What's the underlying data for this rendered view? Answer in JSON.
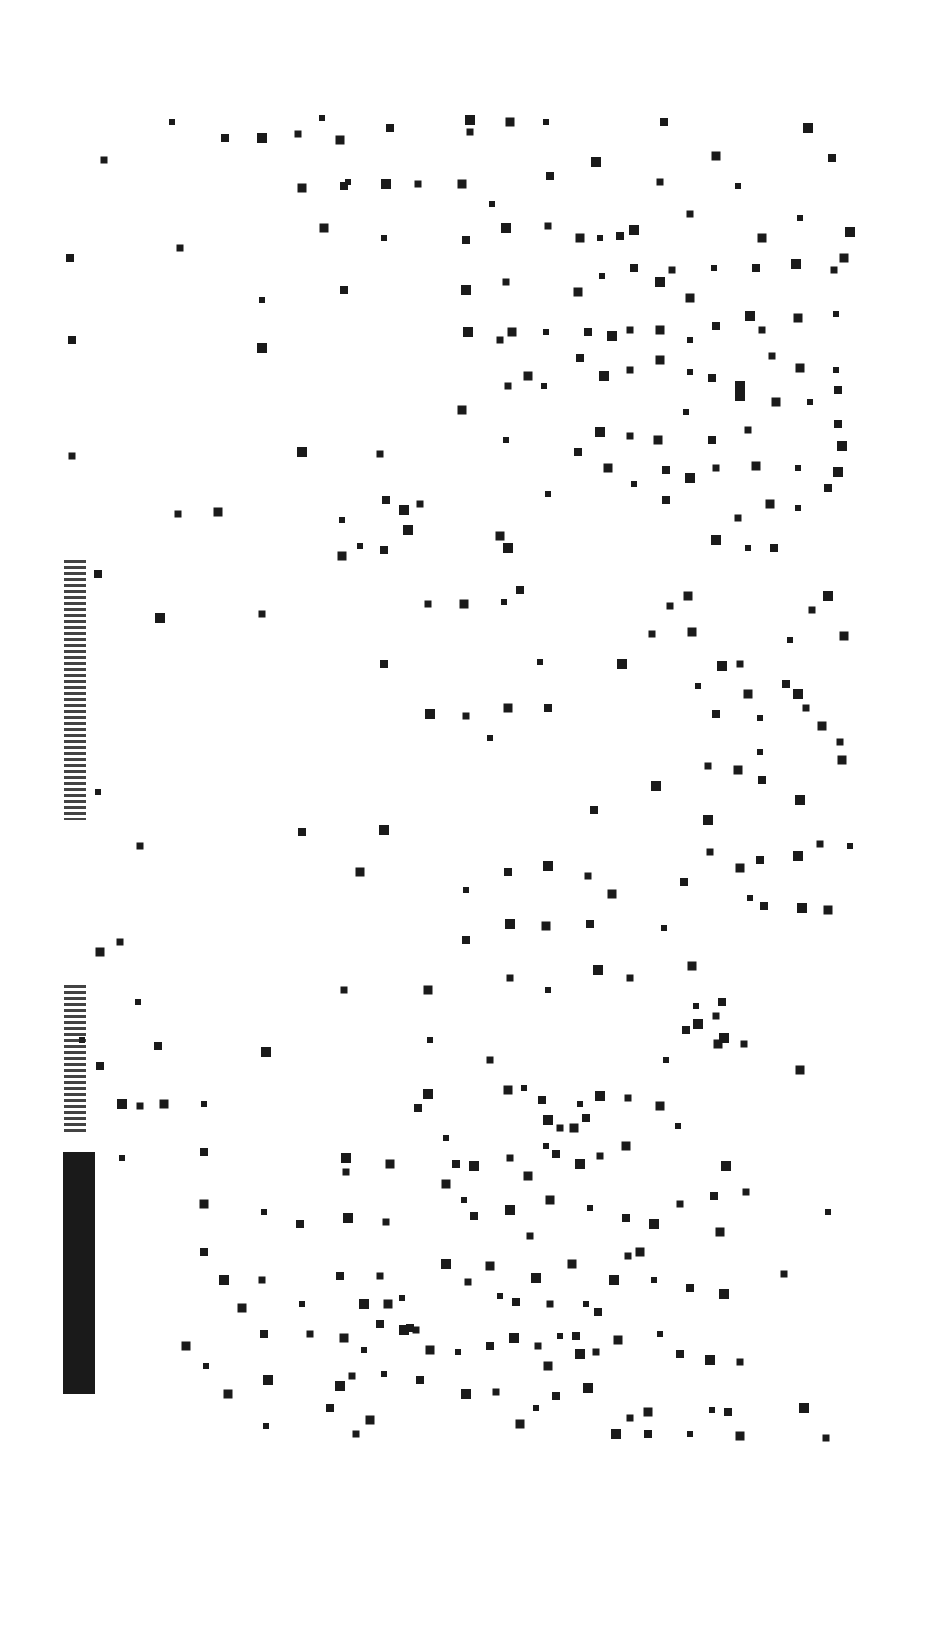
{
  "chart_data": {
    "type": "scatter",
    "title": "",
    "xlabel": "",
    "ylabel": "",
    "grid": false,
    "legend": null,
    "marker": "square",
    "marker_color": "#1a1a1a",
    "background": "#ffffff",
    "points": [
      [
        172,
        122
      ],
      [
        225,
        138
      ],
      [
        262,
        138
      ],
      [
        298,
        134
      ],
      [
        340,
        140
      ],
      [
        322,
        118
      ],
      [
        390,
        128
      ],
      [
        470,
        120
      ],
      [
        470,
        132
      ],
      [
        510,
        122
      ],
      [
        546,
        122
      ],
      [
        664,
        122
      ],
      [
        808,
        128
      ],
      [
        104,
        160
      ],
      [
        302,
        188
      ],
      [
        348,
        182
      ],
      [
        344,
        186
      ],
      [
        386,
        184
      ],
      [
        418,
        184
      ],
      [
        462,
        184
      ],
      [
        492,
        204
      ],
      [
        550,
        176
      ],
      [
        596,
        162
      ],
      [
        660,
        182
      ],
      [
        716,
        156
      ],
      [
        738,
        186
      ],
      [
        832,
        158
      ],
      [
        850,
        232
      ],
      [
        180,
        248
      ],
      [
        324,
        228
      ],
      [
        384,
        238
      ],
      [
        466,
        240
      ],
      [
        506,
        228
      ],
      [
        548,
        226
      ],
      [
        580,
        238
      ],
      [
        600,
        238
      ],
      [
        620,
        236
      ],
      [
        634,
        230
      ],
      [
        690,
        214
      ],
      [
        762,
        238
      ],
      [
        800,
        218
      ],
      [
        70,
        258
      ],
      [
        466,
        290
      ],
      [
        506,
        282
      ],
      [
        578,
        292
      ],
      [
        602,
        276
      ],
      [
        634,
        268
      ],
      [
        660,
        282
      ],
      [
        672,
        270
      ],
      [
        690,
        298
      ],
      [
        714,
        268
      ],
      [
        756,
        268
      ],
      [
        796,
        264
      ],
      [
        834,
        270
      ],
      [
        844,
        258
      ],
      [
        262,
        300
      ],
      [
        344,
        290
      ],
      [
        468,
        332
      ],
      [
        500,
        340
      ],
      [
        512,
        332
      ],
      [
        546,
        332
      ],
      [
        588,
        332
      ],
      [
        612,
        336
      ],
      [
        630,
        330
      ],
      [
        660,
        330
      ],
      [
        690,
        340
      ],
      [
        716,
        326
      ],
      [
        750,
        316
      ],
      [
        762,
        330
      ],
      [
        798,
        318
      ],
      [
        836,
        314
      ],
      [
        72,
        340
      ],
      [
        262,
        348
      ],
      [
        508,
        386
      ],
      [
        528,
        376
      ],
      [
        544,
        386
      ],
      [
        580,
        358
      ],
      [
        604,
        376
      ],
      [
        630,
        370
      ],
      [
        660,
        360
      ],
      [
        690,
        372
      ],
      [
        712,
        378
      ],
      [
        740,
        386
      ],
      [
        772,
        356
      ],
      [
        800,
        368
      ],
      [
        836,
        370
      ],
      [
        838,
        390
      ],
      [
        302,
        452
      ],
      [
        380,
        454
      ],
      [
        462,
        410
      ],
      [
        506,
        440
      ],
      [
        578,
        452
      ],
      [
        600,
        432
      ],
      [
        630,
        436
      ],
      [
        658,
        440
      ],
      [
        686,
        412
      ],
      [
        712,
        440
      ],
      [
        740,
        396
      ],
      [
        748,
        430
      ],
      [
        776,
        402
      ],
      [
        810,
        402
      ],
      [
        838,
        424
      ],
      [
        842,
        446
      ],
      [
        72,
        456
      ],
      [
        608,
        468
      ],
      [
        634,
        484
      ],
      [
        666,
        470
      ],
      [
        690,
        478
      ],
      [
        716,
        468
      ],
      [
        756,
        466
      ],
      [
        798,
        468
      ],
      [
        828,
        488
      ],
      [
        838,
        472
      ],
      [
        178,
        514
      ],
      [
        218,
        512
      ],
      [
        342,
        520
      ],
      [
        386,
        500
      ],
      [
        404,
        510
      ],
      [
        420,
        504
      ],
      [
        500,
        536
      ],
      [
        548,
        494
      ],
      [
        666,
        500
      ],
      [
        716,
        540
      ],
      [
        738,
        518
      ],
      [
        770,
        504
      ],
      [
        798,
        508
      ],
      [
        98,
        574
      ],
      [
        160,
        618
      ],
      [
        262,
        614
      ],
      [
        342,
        556
      ],
      [
        360,
        546
      ],
      [
        384,
        550
      ],
      [
        408,
        530
      ],
      [
        428,
        604
      ],
      [
        464,
        604
      ],
      [
        504,
        602
      ],
      [
        520,
        590
      ],
      [
        508,
        548
      ],
      [
        670,
        606
      ],
      [
        688,
        596
      ],
      [
        748,
        548
      ],
      [
        774,
        548
      ],
      [
        828,
        596
      ],
      [
        812,
        610
      ],
      [
        844,
        636
      ],
      [
        790,
        640
      ],
      [
        384,
        664
      ],
      [
        430,
        714
      ],
      [
        466,
        716
      ],
      [
        508,
        708
      ],
      [
        540,
        662
      ],
      [
        548,
        708
      ],
      [
        622,
        664
      ],
      [
        652,
        634
      ],
      [
        692,
        632
      ],
      [
        698,
        686
      ],
      [
        716,
        714
      ],
      [
        722,
        666
      ],
      [
        740,
        664
      ],
      [
        748,
        694
      ],
      [
        760,
        718
      ],
      [
        786,
        684
      ],
      [
        798,
        694
      ],
      [
        806,
        708
      ],
      [
        822,
        726
      ],
      [
        490,
        738
      ],
      [
        594,
        810
      ],
      [
        656,
        786
      ],
      [
        708,
        766
      ],
      [
        738,
        770
      ],
      [
        760,
        752
      ],
      [
        762,
        780
      ],
      [
        800,
        800
      ],
      [
        840,
        742
      ],
      [
        842,
        760
      ],
      [
        98,
        792
      ],
      [
        302,
        832
      ],
      [
        384,
        830
      ],
      [
        140,
        846
      ],
      [
        360,
        872
      ],
      [
        466,
        890
      ],
      [
        508,
        872
      ],
      [
        548,
        866
      ],
      [
        588,
        876
      ],
      [
        612,
        894
      ],
      [
        664,
        928
      ],
      [
        684,
        882
      ],
      [
        708,
        820
      ],
      [
        710,
        852
      ],
      [
        740,
        868
      ],
      [
        750,
        898
      ],
      [
        760,
        860
      ],
      [
        798,
        856
      ],
      [
        820,
        844
      ],
      [
        828,
        910
      ],
      [
        850,
        846
      ],
      [
        764,
        906
      ],
      [
        802,
        908
      ],
      [
        120,
        942
      ],
      [
        100,
        952
      ],
      [
        138,
        1002
      ],
      [
        158,
        1046
      ],
      [
        266,
        1052
      ],
      [
        344,
        990
      ],
      [
        428,
        990
      ],
      [
        430,
        1040
      ],
      [
        466,
        940
      ],
      [
        510,
        924
      ],
      [
        510,
        978
      ],
      [
        546,
        926
      ],
      [
        548,
        990
      ],
      [
        590,
        924
      ],
      [
        598,
        970
      ],
      [
        630,
        978
      ],
      [
        692,
        966
      ],
      [
        696,
        1006
      ],
      [
        722,
        1002
      ],
      [
        724,
        1038
      ],
      [
        744,
        1044
      ],
      [
        800,
        1070
      ],
      [
        82,
        1040
      ],
      [
        100,
        1066
      ],
      [
        122,
        1104
      ],
      [
        140,
        1106
      ],
      [
        164,
        1104
      ],
      [
        204,
        1104
      ],
      [
        418,
        1108
      ],
      [
        428,
        1094
      ],
      [
        490,
        1060
      ],
      [
        508,
        1090
      ],
      [
        524,
        1088
      ],
      [
        542,
        1100
      ],
      [
        548,
        1120
      ],
      [
        560,
        1128
      ],
      [
        574,
        1128
      ],
      [
        580,
        1104
      ],
      [
        586,
        1118
      ],
      [
        600,
        1096
      ],
      [
        628,
        1098
      ],
      [
        660,
        1106
      ],
      [
        666,
        1060
      ],
      [
        686,
        1030
      ],
      [
        698,
        1024
      ],
      [
        716,
        1016
      ],
      [
        718,
        1044
      ],
      [
        122,
        1158
      ],
      [
        204,
        1152
      ],
      [
        346,
        1158
      ],
      [
        346,
        1172
      ],
      [
        390,
        1164
      ],
      [
        446,
        1138
      ],
      [
        456,
        1164
      ],
      [
        474,
        1166
      ],
      [
        510,
        1158
      ],
      [
        528,
        1176
      ],
      [
        546,
        1146
      ],
      [
        556,
        1154
      ],
      [
        580,
        1164
      ],
      [
        600,
        1156
      ],
      [
        626,
        1146
      ],
      [
        678,
        1126
      ],
      [
        714,
        1196
      ],
      [
        726,
        1166
      ],
      [
        746,
        1192
      ],
      [
        204,
        1204
      ],
      [
        264,
        1212
      ],
      [
        300,
        1224
      ],
      [
        348,
        1218
      ],
      [
        386,
        1222
      ],
      [
        446,
        1184
      ],
      [
        464,
        1200
      ],
      [
        474,
        1216
      ],
      [
        510,
        1210
      ],
      [
        530,
        1236
      ],
      [
        550,
        1200
      ],
      [
        590,
        1208
      ],
      [
        626,
        1218
      ],
      [
        654,
        1224
      ],
      [
        680,
        1204
      ],
      [
        720,
        1232
      ],
      [
        828,
        1212
      ],
      [
        204,
        1252
      ],
      [
        224,
        1280
      ],
      [
        262,
        1280
      ],
      [
        242,
        1308
      ],
      [
        302,
        1304
      ],
      [
        340,
        1276
      ],
      [
        364,
        1304
      ],
      [
        380,
        1276
      ],
      [
        388,
        1304
      ],
      [
        402,
        1298
      ],
      [
        410,
        1328
      ],
      [
        446,
        1264
      ],
      [
        468,
        1282
      ],
      [
        490,
        1266
      ],
      [
        500,
        1296
      ],
      [
        516,
        1302
      ],
      [
        536,
        1278
      ],
      [
        550,
        1304
      ],
      [
        572,
        1264
      ],
      [
        586,
        1304
      ],
      [
        598,
        1312
      ],
      [
        614,
        1280
      ],
      [
        628,
        1256
      ],
      [
        640,
        1252
      ],
      [
        654,
        1280
      ],
      [
        690,
        1288
      ],
      [
        724,
        1294
      ],
      [
        784,
        1274
      ],
      [
        186,
        1346
      ],
      [
        206,
        1366
      ],
      [
        264,
        1334
      ],
      [
        268,
        1380
      ],
      [
        310,
        1334
      ],
      [
        344,
        1338
      ],
      [
        364,
        1350
      ],
      [
        380,
        1324
      ],
      [
        404,
        1330
      ],
      [
        416,
        1330
      ],
      [
        430,
        1350
      ],
      [
        458,
        1352
      ],
      [
        490,
        1346
      ],
      [
        514,
        1338
      ],
      [
        538,
        1346
      ],
      [
        548,
        1366
      ],
      [
        560,
        1336
      ],
      [
        576,
        1336
      ],
      [
        580,
        1354
      ],
      [
        596,
        1352
      ],
      [
        618,
        1340
      ],
      [
        660,
        1334
      ],
      [
        680,
        1354
      ],
      [
        710,
        1360
      ],
      [
        740,
        1362
      ],
      [
        228,
        1394
      ],
      [
        266,
        1426
      ],
      [
        330,
        1408
      ],
      [
        340,
        1386
      ],
      [
        352,
        1376
      ],
      [
        370,
        1420
      ],
      [
        384,
        1374
      ],
      [
        420,
        1380
      ],
      [
        466,
        1394
      ],
      [
        496,
        1392
      ],
      [
        520,
        1424
      ],
      [
        536,
        1408
      ],
      [
        556,
        1396
      ],
      [
        588,
        1388
      ],
      [
        630,
        1418
      ],
      [
        648,
        1412
      ],
      [
        712,
        1410
      ],
      [
        728,
        1412
      ],
      [
        804,
        1408
      ],
      [
        826,
        1438
      ],
      [
        740,
        1436
      ],
      [
        690,
        1434
      ],
      [
        648,
        1434
      ],
      [
        616,
        1434
      ],
      [
        356,
        1434
      ]
    ],
    "marker_size": 8
  },
  "annotations": {
    "left_axis_text": "illegible (degraded, rotated)"
  }
}
